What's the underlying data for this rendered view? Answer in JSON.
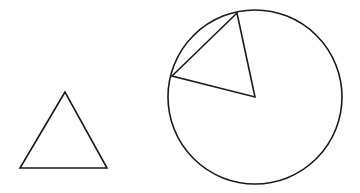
{
  "diagram": {
    "stroke_color": "#1a1a1a",
    "background_color": "#ffffff",
    "shapes": {
      "triangle": {
        "type": "triangle",
        "points": [
          [
            65,
            92
          ],
          [
            20,
            168
          ],
          [
            107,
            168
          ]
        ]
      },
      "circle": {
        "type": "circle",
        "center": [
          255,
          97
        ],
        "radius": 87
      },
      "sector_triangle": {
        "type": "triangle",
        "points": [
          [
            237,
            13
          ],
          [
            172,
            76
          ],
          [
            255,
            97
          ]
        ],
        "note": "vertex at circle center; two other vertices on circumference"
      }
    }
  }
}
